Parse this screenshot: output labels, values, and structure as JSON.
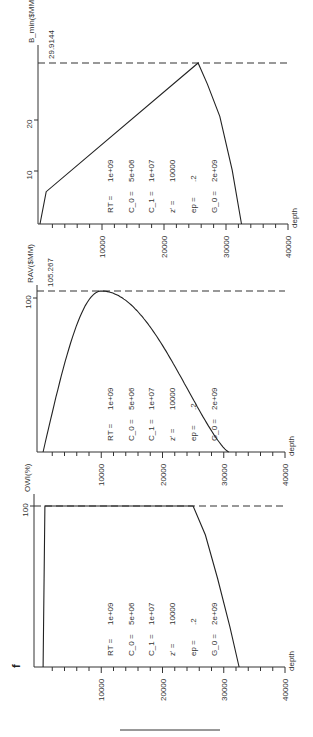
{
  "figure_label": "f",
  "chart_data": [
    {
      "type": "line",
      "title": "",
      "ylabel": "B_min($MM)",
      "xlabel": "depth",
      "xlim": [
        0,
        40000
      ],
      "ylim": [
        0,
        32
      ],
      "x_ticks": [
        "10000",
        "20000",
        "30000",
        "40000"
      ],
      "y_ticks": [
        "10",
        "20"
      ],
      "max_marker": {
        "label": "29.9144",
        "value": 29.9144
      },
      "x": [
        0,
        1000,
        25500,
        27000,
        29000,
        31000,
        32500
      ],
      "values": [
        0,
        6,
        29.9144,
        26,
        20,
        10,
        0
      ],
      "params": [
        {
          "label": "RT =",
          "value": "1e+09"
        },
        {
          "label": "C_0 =",
          "value": "5e+06"
        },
        {
          "label": "C_1 =",
          "value": "1e+07"
        },
        {
          "label": "z' =",
          "value": "10000"
        },
        {
          "label": "ep =",
          "value": ".2"
        },
        {
          "label": "G_0 =",
          "value": "2e+09"
        }
      ]
    },
    {
      "type": "line",
      "title": "",
      "ylabel": "RAV($MM)",
      "xlabel": "depth",
      "xlim": [
        0,
        40000
      ],
      "ylim": [
        0,
        110
      ],
      "x_ticks": [
        "10000",
        "20000",
        "30000",
        "40000"
      ],
      "y_ticks": [
        "100"
      ],
      "max_marker": {
        "label": "105.267",
        "value": 105.267
      },
      "x": [
        500,
        3000,
        6000,
        10000,
        14000,
        18000,
        22000,
        26000,
        30800
      ],
      "values": [
        0,
        55,
        90,
        105.267,
        95,
        75,
        50,
        25,
        0
      ],
      "params": [
        {
          "label": "RT =",
          "value": "1e+09"
        },
        {
          "label": "C_0 =",
          "value": "5e+06"
        },
        {
          "label": "C_1 =",
          "value": "1e+07"
        },
        {
          "label": "z' =",
          "value": "10000"
        },
        {
          "label": "ep =",
          "value": ".2"
        },
        {
          "label": "G_0 =",
          "value": "2e+09"
        }
      ]
    },
    {
      "type": "line",
      "title": "",
      "ylabel": "OWI(%)",
      "xlabel": "depth",
      "xlim": [
        0,
        40000
      ],
      "ylim": [
        0,
        100
      ],
      "x_ticks": [
        "10000",
        "20000",
        "30000",
        "40000"
      ],
      "y_ticks": [
        "100"
      ],
      "max_marker": {
        "label": "",
        "value": 100
      },
      "x": [
        500,
        800,
        25000,
        27000,
        29000,
        31000,
        32500
      ],
      "values": [
        0,
        100,
        100,
        82,
        55,
        25,
        0
      ],
      "params": [
        {
          "label": "RT =",
          "value": "1e+09"
        },
        {
          "label": "C_0 =",
          "value": "5e+06"
        },
        {
          "label": "C_1 =",
          "value": "1e+07"
        },
        {
          "label": "z' =",
          "value": "10000"
        },
        {
          "label": "ep =",
          "value": ".2"
        },
        {
          "label": "G_0 =",
          "value": "2e+09"
        }
      ]
    }
  ]
}
